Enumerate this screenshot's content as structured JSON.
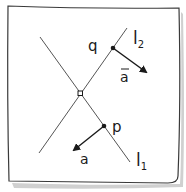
{
  "diagram": {
    "lines": [
      {
        "id": "l1",
        "label": "l",
        "subscript": "1"
      },
      {
        "id": "l2",
        "label": "l",
        "subscript": "2"
      }
    ],
    "points": [
      {
        "id": "q",
        "label": "q"
      },
      {
        "id": "p",
        "label": "p"
      },
      {
        "id": "intersection",
        "label": ""
      }
    ],
    "vectors": [
      {
        "id": "a_bar",
        "label": "a",
        "overbar": true,
        "origin": "q"
      },
      {
        "id": "a",
        "label": "a",
        "overbar": false,
        "origin": "p"
      }
    ],
    "colors": {
      "ink": "#1a1a1a",
      "line": "#555555",
      "paper_shadow": "#c8c8c8"
    }
  }
}
